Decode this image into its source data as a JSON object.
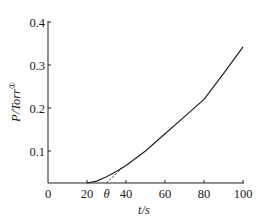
{
  "chart_data": {
    "type": "line",
    "title": "",
    "xlabel": "t/s",
    "ylabel": "P/Torr",
    "ylabel_superscript": "①",
    "xlim": [
      0,
      100
    ],
    "ylim": [
      0.025,
      0.4
    ],
    "x_ticks": [
      0,
      20,
      40,
      60,
      80,
      100
    ],
    "x_tick_labels": [
      "0",
      "20",
      "40",
      "60",
      "80",
      "100"
    ],
    "y_ticks": [
      0.1,
      0.2,
      0.3,
      0.4
    ],
    "y_tick_labels": [
      "0.1",
      "0.2",
      "0.3",
      "0.4"
    ],
    "annotations": [
      {
        "text": "θ",
        "x": 30,
        "note": "time-lag intercept of dashed linear extrapolation on t-axis"
      }
    ],
    "grid": false,
    "legend": null,
    "series": [
      {
        "name": "P(t)",
        "style": "solid",
        "x": [
          20,
          25,
          30,
          35,
          40,
          50,
          60,
          70,
          80,
          90,
          100
        ],
        "y": [
          0.025,
          0.03,
          0.04,
          0.052,
          0.066,
          0.1,
          0.14,
          0.18,
          0.22,
          0.28,
          0.342
        ]
      },
      {
        "name": "linear extrapolation",
        "style": "dashed",
        "x": [
          30,
          38
        ],
        "y": [
          0.025,
          0.06
        ]
      }
    ]
  }
}
